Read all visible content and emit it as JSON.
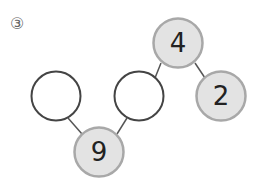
{
  "problem": {
    "label": "③"
  },
  "diagram": {
    "colors": {
      "filled_node_fill": "#e3e3e3",
      "filled_node_stroke": "#a8a8a8",
      "empty_node_stroke": "#444444",
      "edge": "#555555"
    },
    "nodes": [
      {
        "id": "top",
        "value": "4",
        "filled": true
      },
      {
        "id": "right",
        "value": "2",
        "filled": true
      },
      {
        "id": "middle-empty",
        "value": "",
        "filled": false
      },
      {
        "id": "left-empty",
        "value": "",
        "filled": false
      },
      {
        "id": "bottom",
        "value": "9",
        "filled": true
      }
    ],
    "edges": [
      [
        "top",
        "middle-empty"
      ],
      [
        "top",
        "right"
      ],
      [
        "bottom",
        "left-empty"
      ],
      [
        "bottom",
        "middle-empty"
      ]
    ]
  }
}
